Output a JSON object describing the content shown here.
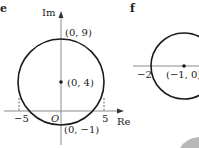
{
  "panels": [
    {
      "letter": "e",
      "axes": {
        "x_label": "Re",
        "y_label": "Im",
        "origin_label": "O"
      },
      "circle": {
        "center": [
          0,
          4
        ],
        "radius": 5
      },
      "points": [
        {
          "label": "(0, 9)"
        },
        {
          "label": "(0, 4)"
        },
        {
          "label": "(0, −1)"
        }
      ],
      "ticks": {
        "neg": "−5",
        "pos": "5"
      }
    },
    {
      "letter": "f",
      "circle": {
        "center": [
          -1,
          0
        ],
        "radius": 1
      },
      "points": [
        {
          "label": "(−1, 0)"
        }
      ],
      "ticks": {
        "neg": "−2"
      }
    }
  ],
  "colors": {
    "ink": "#1a1a1a",
    "axis": "#808080",
    "blob": "#b8b8b8"
  }
}
